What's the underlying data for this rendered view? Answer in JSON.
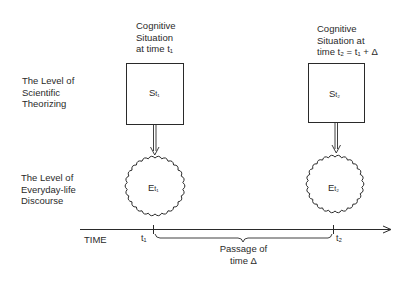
{
  "levels": {
    "scientific": [
      "The Level of",
      "Scientific",
      "Theorizing"
    ],
    "everyday": [
      "The Level of",
      "Everyday-life",
      "Discourse"
    ]
  },
  "situations": [
    {
      "caption": [
        "Cognitive",
        "Situation",
        "at time t₁"
      ],
      "box_label": "S",
      "box_sub": "t₁",
      "cloud_label": "E",
      "cloud_sub": "t₁"
    },
    {
      "caption": [
        "Cognitive",
        "Situation at",
        "time t₂ = t₁ + Δ"
      ],
      "box_label": "S",
      "box_sub": "t₂",
      "cloud_label": "E",
      "cloud_sub": "t₂"
    }
  ],
  "axis": {
    "label": "TIME",
    "tick1": "t₁",
    "tick2": "t₂",
    "brace_label": [
      "Passage of",
      "time Δ"
    ]
  },
  "colors": {
    "ink": "#2a2a2a",
    "background": "#ffffff"
  }
}
